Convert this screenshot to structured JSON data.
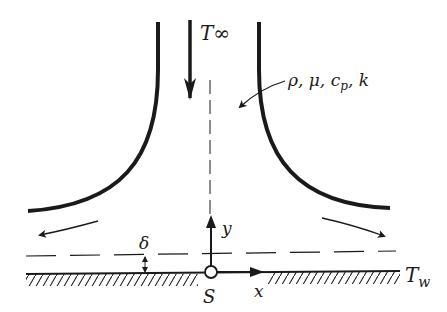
{
  "diagram": {
    "labels": {
      "free_stream_temperature": "T∞",
      "fluid_properties": "ρ, μ, c",
      "cp_subscript": "p",
      "k_suffix": ", k",
      "boundary_layer_thickness": "δ",
      "y_axis": "y",
      "x_axis": "x",
      "stagnation_point": "S",
      "wall_temperature": "T",
      "wall_temperature_subscript": "w"
    },
    "colors": {
      "ink": "#1a1a1a",
      "background": "#ffffff"
    }
  }
}
